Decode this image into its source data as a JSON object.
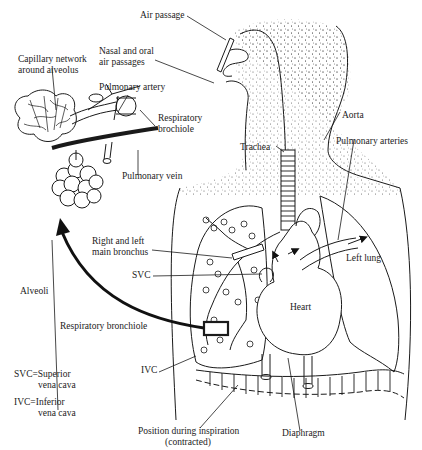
{
  "diagram": {
    "type": "anatomical illustration",
    "colors": {
      "line": "#1a1a1a",
      "background": "#ffffff",
      "stipple": "#555555"
    }
  },
  "labels": {
    "air_passage": "Air passage",
    "nasal_oral_1": "Nasal and oral",
    "nasal_oral_2": "air passages",
    "capillary_1": "Capillary network",
    "capillary_2": "around alveolus",
    "pulmonary_artery": "Pulmonary artery",
    "resp_brochiole_1": "Respiratory",
    "resp_brochiole_2": "brochiole",
    "pulmonary_vein": "Pulmonary vein",
    "trachea": "Trachea",
    "aorta": "Aorta",
    "pulmonary_arteries": "Pulmonary arteries",
    "main_bronchus_1": "Right and left",
    "main_bronchus_2": "main bronchus",
    "left_lung": "Left lung",
    "svc": "SVC",
    "alveoli": "Alveoli",
    "heart": "Heart",
    "resp_bronchiole": "Respiratory bronchiole",
    "ivc": "IVC",
    "legend_svc_1": "SVC=Superior",
    "legend_svc_2": "vena cava",
    "legend_ivc_1": "IVC=Inferior",
    "legend_ivc_2": "vena cava",
    "inspiration_1": "Position during inspiration",
    "inspiration_2": "(contracted)",
    "diaphragm": "Diaphragm"
  }
}
